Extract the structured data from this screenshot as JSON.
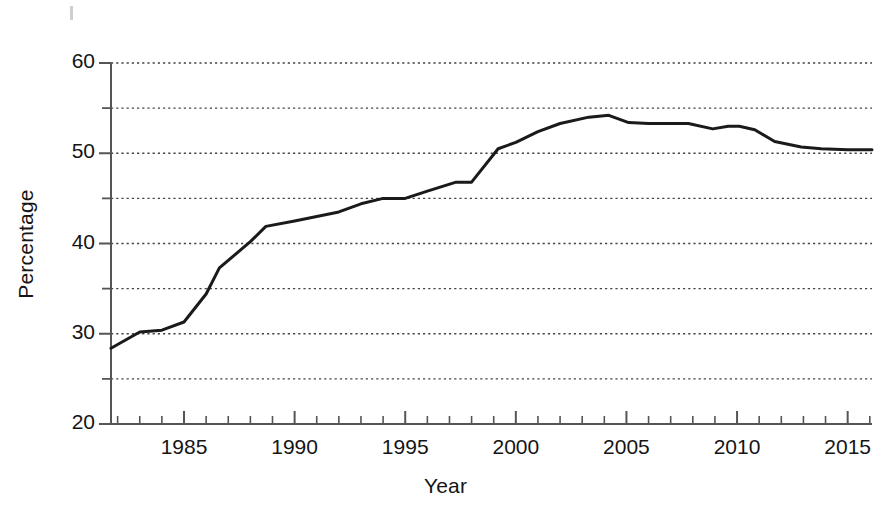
{
  "chart_data": {
    "type": "line",
    "title": "",
    "xlabel": "Year",
    "ylabel": "Percentage",
    "xlim": [
      1981.7,
      2016.1
    ],
    "ylim": [
      20,
      60
    ],
    "y_major_ticks": [
      20,
      30,
      40,
      50,
      60
    ],
    "y_minor_ticks": [
      25,
      35,
      45,
      55
    ],
    "y_tick_labels": [
      "20",
      "30",
      "40",
      "50",
      "60"
    ],
    "x_major_ticks": [
      1985,
      1990,
      1995,
      2000,
      2005,
      2010,
      2015
    ],
    "x_tick_labels": [
      "1985",
      "1990",
      "1995",
      "2000",
      "2005",
      "2010",
      "2015"
    ],
    "x_minor_tick_step": 1,
    "grid": "horizontal-dotted",
    "legend": "none",
    "line_color": "#1a1a1a",
    "line_width": 3,
    "x": [
      1981.7,
      1983,
      1984,
      1985,
      1986,
      1986.6,
      1988,
      1988.7,
      1990,
      1991,
      1992,
      1993,
      1994,
      1995,
      1996,
      1997.3,
      1998,
      1999.2,
      2000,
      2001,
      2002,
      2003.3,
      2004.2,
      2005.1,
      2006,
      2007,
      2007.8,
      2008.9,
      2009.6,
      2010.1,
      2010.8,
      2011.7,
      2012.9,
      2013.8,
      2015,
      2016.1
    ],
    "y": [
      28.4,
      30.2,
      30.4,
      31.3,
      34.4,
      37.3,
      40.2,
      41.9,
      42.5,
      43.0,
      43.5,
      44.4,
      45.0,
      45.0,
      45.8,
      46.8,
      46.8,
      50.5,
      51.2,
      52.4,
      53.3,
      54.0,
      54.2,
      53.4,
      53.3,
      53.3,
      53.3,
      52.7,
      53.0,
      53.0,
      52.6,
      51.3,
      50.7,
      50.5,
      50.4,
      50.4
    ]
  },
  "axis_titles": {
    "y": "Percentage",
    "x": "Year"
  }
}
